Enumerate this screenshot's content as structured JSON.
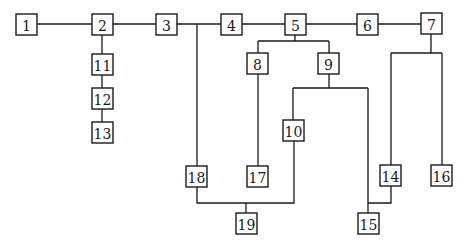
{
  "diagram": {
    "type": "tree",
    "colors": {
      "line": "#1a1a1a",
      "box_fill": "#ffffff",
      "background": "#ffffff"
    },
    "nodes": [
      {
        "id": "1",
        "label": "1",
        "x": 16,
        "y": 14,
        "w": 21,
        "h": 21
      },
      {
        "id": "2",
        "label": "2",
        "x": 92,
        "y": 14,
        "w": 21,
        "h": 21
      },
      {
        "id": "3",
        "label": "3",
        "x": 156,
        "y": 14,
        "w": 21,
        "h": 21
      },
      {
        "id": "4",
        "label": "4",
        "x": 221,
        "y": 14,
        "w": 21,
        "h": 21
      },
      {
        "id": "5",
        "label": "5",
        "x": 285,
        "y": 14,
        "w": 21,
        "h": 21
      },
      {
        "id": "6",
        "label": "6",
        "x": 357,
        "y": 14,
        "w": 21,
        "h": 21
      },
      {
        "id": "7",
        "label": "7",
        "x": 421,
        "y": 13,
        "w": 21,
        "h": 21
      },
      {
        "id": "8",
        "label": "8",
        "x": 247,
        "y": 53,
        "w": 21,
        "h": 21
      },
      {
        "id": "9",
        "label": "9",
        "x": 318,
        "y": 53,
        "w": 21,
        "h": 21
      },
      {
        "id": "10",
        "label": "10",
        "x": 283,
        "y": 120,
        "w": 21,
        "h": 21
      },
      {
        "id": "11",
        "label": "11",
        "x": 92,
        "y": 54,
        "w": 21,
        "h": 21
      },
      {
        "id": "12",
        "label": "12",
        "x": 92,
        "y": 88,
        "w": 21,
        "h": 21
      },
      {
        "id": "13",
        "label": "13",
        "x": 92,
        "y": 122,
        "w": 21,
        "h": 21
      },
      {
        "id": "14",
        "label": "14",
        "x": 380,
        "y": 165,
        "w": 21,
        "h": 21
      },
      {
        "id": "15",
        "label": "15",
        "x": 358,
        "y": 213,
        "w": 21,
        "h": 21
      },
      {
        "id": "16",
        "label": "16",
        "x": 431,
        "y": 165,
        "w": 21,
        "h": 21
      },
      {
        "id": "17",
        "label": "17",
        "x": 247,
        "y": 166,
        "w": 21,
        "h": 21
      },
      {
        "id": "18",
        "label": "18",
        "x": 186,
        "y": 166,
        "w": 21,
        "h": 21
      },
      {
        "id": "19",
        "label": "19",
        "x": 236,
        "y": 213,
        "w": 21,
        "h": 21
      }
    ],
    "edges": [
      {
        "from": "1",
        "to": "2"
      },
      {
        "from": "2",
        "to": "3"
      },
      {
        "from": "3",
        "to": "4"
      },
      {
        "from": "4",
        "to": "5"
      },
      {
        "from": "5",
        "to": "6"
      },
      {
        "from": "6",
        "to": "7"
      },
      {
        "from": "2",
        "to": "11"
      },
      {
        "from": "11",
        "to": "12"
      },
      {
        "from": "12",
        "to": "13"
      },
      {
        "from": "3-4",
        "to": "18"
      },
      {
        "from": "5",
        "to": "8"
      },
      {
        "from": "5",
        "to": "9"
      },
      {
        "from": "8",
        "to": "17"
      },
      {
        "from": "9",
        "to": "10"
      },
      {
        "from": "9",
        "to": "15"
      },
      {
        "from": "7",
        "to": "14"
      },
      {
        "from": "7",
        "to": "16"
      },
      {
        "from": "14",
        "to": "15"
      },
      {
        "from": "18",
        "to": "19"
      },
      {
        "from": "10",
        "to": "19"
      }
    ],
    "paths": [
      "M37,24 L92,24",
      "M113,24 L156,24",
      "M177,24 L221,24",
      "M242,24 L285,24",
      "M306,24 L357,24",
      "M378,24 L421,24",
      "M102,35 L102,54",
      "M102,75 L102,88",
      "M102,109 L102,122",
      "M197,24 L197,166",
      "M295,35 L295,41 M258,41 L329,41 M258,41 L258,53 M329,41 L329,53",
      "M258,74 L258,166",
      "M329,74 L329,88 M293,88 L368,88 M293,88 L293,120 M368,88 L368,213",
      "M431,34 L431,53 M391,53 L442,53 M391,53 L391,165 M442,53 L442,165",
      "M391,186 L391,203 L368,203",
      "M197,187 L197,203 L294,203 L294,141",
      "M246,203 L246,213"
    ]
  }
}
